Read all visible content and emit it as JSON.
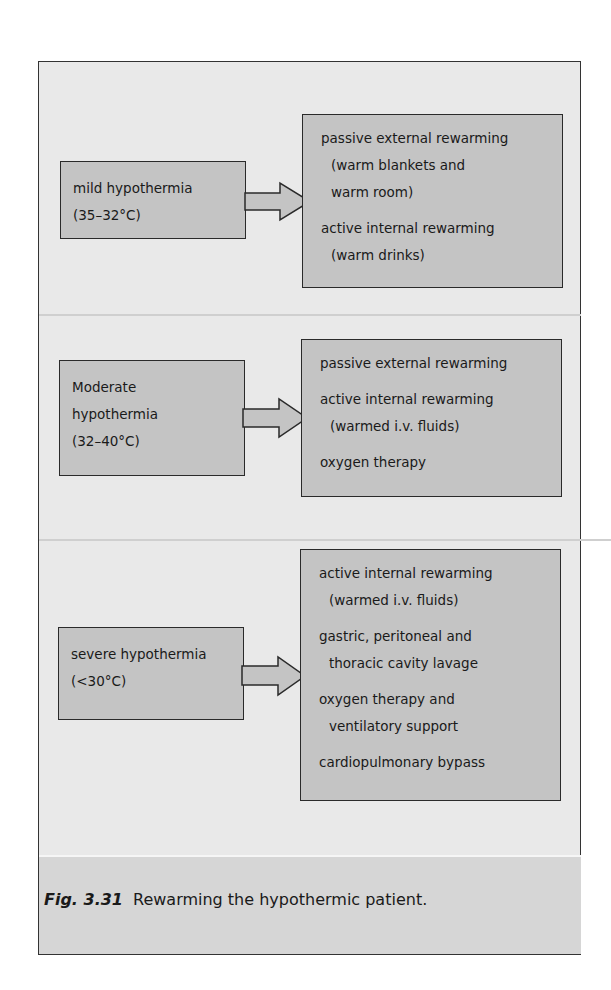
{
  "figure": {
    "sections": [
      {
        "condition": [
          "mild hypothermia",
          "(35–32°C)"
        ],
        "treatments": [
          {
            "text": "passive external rewarming",
            "indent": false,
            "gap": false
          },
          {
            "text": "(warm blankets and",
            "indent": true,
            "gap": false
          },
          {
            "text": "warm room)",
            "indent": true,
            "gap": false
          },
          {
            "text": "active internal rewarming",
            "indent": false,
            "gap": true
          },
          {
            "text": "(warm drinks)",
            "indent": true,
            "gap": false
          }
        ]
      },
      {
        "condition": [
          "Moderate",
          "hypothermia",
          "(32–40°C)"
        ],
        "treatments": [
          {
            "text": "passive external rewarming",
            "indent": false,
            "gap": false
          },
          {
            "text": "active internal rewarming",
            "indent": false,
            "gap": true
          },
          {
            "text": "(warmed i.v. fluids)",
            "indent": true,
            "gap": false
          },
          {
            "text": "oxygen therapy",
            "indent": false,
            "gap": true
          }
        ]
      },
      {
        "condition": [
          "severe hypothermia",
          "(<30°C)"
        ],
        "treatments": [
          {
            "text": "active internal rewarming",
            "indent": false,
            "gap": false
          },
          {
            "text": "(warmed i.v. fluids)",
            "indent": true,
            "gap": false
          },
          {
            "text": "gastric, peritoneal and",
            "indent": false,
            "gap": true
          },
          {
            "text": "thoracic cavity lavage",
            "indent": true,
            "gap": false
          },
          {
            "text": "oxygen therapy and",
            "indent": false,
            "gap": true
          },
          {
            "text": "ventilatory support",
            "indent": true,
            "gap": false
          },
          {
            "text": "cardiopulmonary bypass",
            "indent": false,
            "gap": true
          }
        ]
      }
    ],
    "caption": {
      "label": "Fig. 3.31",
      "text": "Rewarming the hypothermic patient."
    },
    "colors": {
      "panel": "#e9e9e9",
      "box": "#c4c4c4",
      "caption_band": "#d6d6d6",
      "border": "#2a2a2a"
    }
  }
}
